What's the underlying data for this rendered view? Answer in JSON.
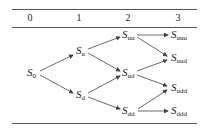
{
  "header": {
    "columns": [
      "0",
      "1",
      "2",
      "3"
    ]
  },
  "nodes": {
    "s0": {
      "base": "S",
      "sub": "0"
    },
    "su": {
      "base": "S",
      "sub": "u"
    },
    "sd": {
      "base": "S",
      "sub": "d"
    },
    "suu": {
      "base": "S",
      "sub": "uu"
    },
    "sud": {
      "base": "S",
      "sub": "ud"
    },
    "sdd": {
      "base": "S",
      "sub": "dd"
    },
    "suuu": {
      "base": "S",
      "sub": "uuu"
    },
    "suud": {
      "base": "S",
      "sub": "uud"
    },
    "sudd": {
      "base": "S",
      "sub": "udd"
    },
    "sddd": {
      "base": "S",
      "sub": "ddd"
    }
  },
  "edges": [
    [
      "s0",
      "su"
    ],
    [
      "s0",
      "sd"
    ],
    [
      "su",
      "suu"
    ],
    [
      "su",
      "sud"
    ],
    [
      "sd",
      "sud"
    ],
    [
      "sd",
      "sdd"
    ],
    [
      "suu",
      "suuu"
    ],
    [
      "suu",
      "suud"
    ],
    [
      "sud",
      "suud"
    ],
    [
      "sud",
      "sudd"
    ],
    [
      "sdd",
      "sudd"
    ],
    [
      "sdd",
      "sddd"
    ]
  ],
  "colors": {
    "line": "#444444",
    "text": "#222222"
  }
}
